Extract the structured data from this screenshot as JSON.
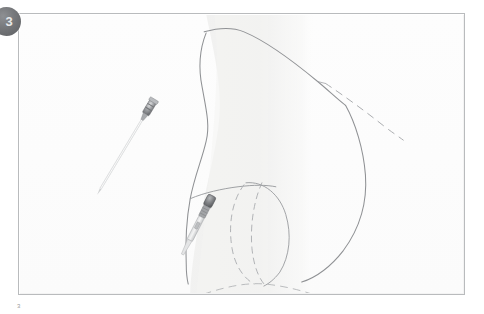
{
  "figure": {
    "step_badge": "3",
    "caption_fragment": "3",
    "frame_border_color": "#b9bbbd",
    "background_color": "#ffffff",
    "sketch_line_color": "#8f9194",
    "sketch_shade_color": "#efefee"
  },
  "illustration": {
    "title": "Surgical sketch: instrument insertion along breast contour",
    "style": "pencil line drawing",
    "elements": [
      {
        "name": "torso-shading",
        "type": "soft-shaded-region",
        "label": "chest wall shading"
      },
      {
        "name": "breast-contour-outline",
        "type": "solid-curve",
        "label": "breast outline"
      },
      {
        "name": "upper-pole-line",
        "type": "solid-curve",
        "label": "upper pole slope"
      },
      {
        "name": "implant-dome-outline",
        "type": "solid-curve",
        "label": "implant dome"
      },
      {
        "name": "implant-dashed-inner",
        "type": "dashed-curve",
        "label": "implant inner margin"
      },
      {
        "name": "implant-dashed-outer",
        "type": "dashed-curve",
        "label": "implant outer margin"
      },
      {
        "name": "inframammary-fold-dashed",
        "type": "dashed-curve",
        "label": "inframammary fold"
      },
      {
        "name": "upper-dashed-guide",
        "type": "dashed-line",
        "label": "upper guide line"
      }
    ],
    "instruments": [
      {
        "name": "instrument-syringe",
        "label": "syringe with long needle",
        "angle_deg": 31,
        "hub_color": "#9b9da0",
        "shaft_color": "#d8d9da"
      },
      {
        "name": "instrument-needle-holder",
        "label": "needle holder / dissector",
        "angle_deg": 27,
        "hub_color": "#7d7f82",
        "shaft_color": "#cfd1d2"
      }
    ]
  }
}
